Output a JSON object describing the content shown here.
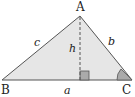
{
  "diagram": {
    "colors": {
      "fill": "#e6e6e6",
      "stroke": "#555555",
      "angle_fill": "#aaaaaa",
      "right_angle_fill": "#aaaaaa",
      "text": "#222222"
    },
    "vertices": [
      {
        "id": "A",
        "label": "A"
      },
      {
        "id": "B",
        "label": "B"
      },
      {
        "id": "C",
        "label": "C"
      }
    ],
    "sides": [
      {
        "id": "a",
        "label": "a",
        "between": "B-C"
      },
      {
        "id": "b",
        "label": "b",
        "between": "A-C"
      },
      {
        "id": "c",
        "label": "c",
        "between": "A-B"
      }
    ],
    "altitude": {
      "label": "h",
      "from": "A",
      "to": "BC",
      "style": "dashed"
    },
    "markers": [
      "right-angle at foot of altitude",
      "angle at C"
    ]
  }
}
